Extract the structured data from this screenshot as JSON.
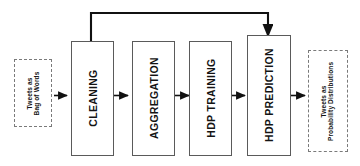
{
  "diagram": {
    "type": "flowchart",
    "orientation": "left-to-right",
    "colors": {
      "background": "#ffffff",
      "process_border": "#5a5a5a",
      "io_border": "#7a7a7a",
      "arrow": "#111111",
      "text": "#141414"
    },
    "nodes": [
      {
        "id": "input",
        "shape": "dashed-rect",
        "label_line1": "Tweets as",
        "label_line2": "Bag of Words",
        "rotation": -90
      },
      {
        "id": "cleaning",
        "shape": "rect",
        "label_line1": "CLEANING",
        "label_line2": "",
        "rotation": -90
      },
      {
        "id": "aggregation",
        "shape": "rect",
        "label_line1": "AGGREGATION",
        "label_line2": "",
        "rotation": -90
      },
      {
        "id": "hdp-training",
        "shape": "rect",
        "label_line1": "HDP TRAINING",
        "label_line2": "",
        "rotation": -90
      },
      {
        "id": "hdp-prediction",
        "shape": "rect",
        "label_line1": "HDP PREDICTION",
        "label_line2": "",
        "rotation": -90
      },
      {
        "id": "output",
        "shape": "dashed-rect",
        "label_line1": "Tweets as",
        "label_line2": "Probability Distributions",
        "rotation": -90
      }
    ],
    "edges": [
      {
        "id": "e1",
        "from": "input",
        "to": "cleaning",
        "style": "solid",
        "arrow": "end"
      },
      {
        "id": "e2",
        "from": "cleaning",
        "to": "aggregation",
        "style": "solid",
        "arrow": "end"
      },
      {
        "id": "e3",
        "from": "aggregation",
        "to": "hdp-training",
        "style": "solid",
        "arrow": "end"
      },
      {
        "id": "e4",
        "from": "hdp-training",
        "to": "hdp-prediction",
        "style": "solid",
        "arrow": "end"
      },
      {
        "id": "e5",
        "from": "hdp-prediction",
        "to": "output",
        "style": "solid",
        "arrow": "end"
      },
      {
        "id": "e6",
        "from": "cleaning",
        "to": "hdp-prediction",
        "style": "solid",
        "arrow": "end",
        "routing": "top-feedback"
      }
    ]
  }
}
